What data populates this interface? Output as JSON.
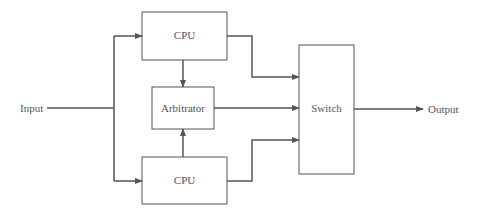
{
  "diagram": {
    "type": "block-diagram",
    "colors": {
      "line": "#555555",
      "background": "#ffffff"
    },
    "inputs": {
      "label": "Input"
    },
    "outputs": {
      "label": "Output"
    },
    "blocks": [
      {
        "id": "cpu_top",
        "label": "CPU"
      },
      {
        "id": "arbitrator",
        "label": "Arbitrator"
      },
      {
        "id": "cpu_bottom",
        "label": "CPU"
      },
      {
        "id": "switch",
        "label": "Switch"
      }
    ],
    "connections": [
      {
        "from": "Input",
        "to": "cpu_top"
      },
      {
        "from": "Input",
        "to": "cpu_bottom"
      },
      {
        "from": "cpu_top",
        "to": "arbitrator"
      },
      {
        "from": "cpu_bottom",
        "to": "arbitrator"
      },
      {
        "from": "cpu_top",
        "to": "switch"
      },
      {
        "from": "arbitrator",
        "to": "switch"
      },
      {
        "from": "cpu_bottom",
        "to": "switch"
      },
      {
        "from": "switch",
        "to": "Output"
      }
    ]
  }
}
